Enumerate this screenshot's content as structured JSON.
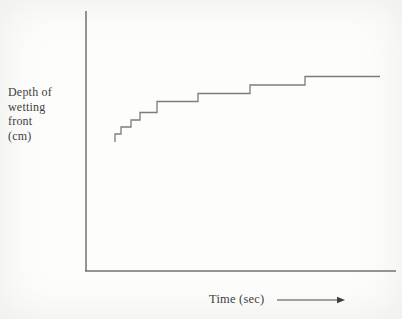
{
  "figure": {
    "background": "#fdfdfc",
    "ink": "#3f3f3f",
    "axis_color": "#636363",
    "curve_color": "#6e6e6e",
    "ylabel_lines": [
      "Depth of",
      "wetting",
      "front",
      "(cm)"
    ],
    "xlabel": "Time (sec)"
  },
  "chart_data": {
    "type": "line",
    "subtype": "step-staircase",
    "title": "",
    "xlabel": "Time (sec)",
    "ylabel": "Depth of wetting front (cm)",
    "x_axis": {
      "ticks": [],
      "numeric_labels": false,
      "direction_arrow": true
    },
    "y_axis": {
      "ticks": [],
      "numeric_labels": false
    },
    "legend": null,
    "grid": false,
    "points_px": [
      [
        115,
        142
      ],
      [
        115,
        134
      ],
      [
        121,
        134
      ],
      [
        121,
        127
      ],
      [
        131,
        127
      ],
      [
        131,
        120
      ],
      [
        140,
        120
      ],
      [
        140,
        112.5
      ],
      [
        157,
        112.5
      ],
      [
        157,
        101.5
      ],
      [
        198,
        101.5
      ],
      [
        198,
        93.5
      ],
      [
        250,
        93.5
      ],
      [
        250,
        85
      ],
      [
        305,
        85
      ],
      [
        305,
        76.5
      ],
      [
        380,
        76.5
      ]
    ],
    "axes_px": {
      "origin": [
        86,
        271
      ],
      "y_top": 11,
      "x_right": 396
    },
    "arrow_px": {
      "x1": 277,
      "x2": 345,
      "y": 300
    }
  }
}
